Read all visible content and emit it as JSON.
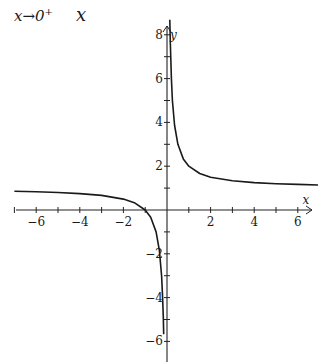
{
  "header": {
    "limit_text": "x→0",
    "limit_sup": "+",
    "variable": "x"
  },
  "chart_data": {
    "type": "line",
    "title": "",
    "function": "y = 1 + 1/x",
    "xlabel": "x",
    "ylabel": "y",
    "xlim": [
      -7,
      7
    ],
    "ylim": [
      -6.5,
      8.5
    ],
    "x_ticks": [
      -6,
      -4,
      -2,
      2,
      4,
      6
    ],
    "y_ticks": [
      -6,
      -4,
      -2,
      2,
      4,
      6,
      8
    ],
    "grid": false,
    "asymptotes": {
      "vertical": 0,
      "horizontal": 1
    },
    "series": [
      {
        "name": "left branch",
        "x": [
          -7,
          -6,
          -5,
          -4,
          -3,
          -2,
          -1.5,
          -1,
          -0.75,
          -0.5,
          -0.35,
          -0.25,
          -0.2,
          -0.17,
          -0.15
        ],
        "y": [
          0.857,
          0.833,
          0.8,
          0.75,
          0.667,
          0.5,
          0.333,
          0,
          -0.333,
          -1,
          -1.857,
          -3,
          -4,
          -4.88,
          -5.67
        ]
      },
      {
        "name": "right branch",
        "x": [
          0.13,
          0.15,
          0.2,
          0.25,
          0.35,
          0.5,
          0.75,
          1,
          1.5,
          2,
          3,
          4,
          5,
          6,
          7
        ],
        "y": [
          8.69,
          7.67,
          6,
          5,
          3.857,
          3,
          2.333,
          2,
          1.667,
          1.5,
          1.333,
          1.25,
          1.2,
          1.167,
          1.143
        ]
      }
    ]
  }
}
